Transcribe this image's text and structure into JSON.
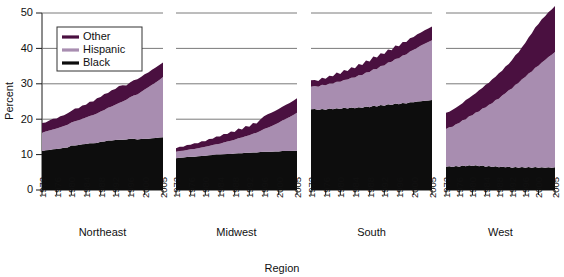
{
  "chart_data": {
    "type": "area",
    "title": "",
    "subtitle": "",
    "xlabel": "Region",
    "ylabel": "Percent",
    "ylim": [
      0,
      50
    ],
    "yticks": [
      0,
      10,
      20,
      30,
      40,
      50
    ],
    "grid": true,
    "stacked": true,
    "legend_position": "top-left",
    "legend": [
      "Other",
      "Hispanic",
      "Black"
    ],
    "series_colors": {
      "Other": "#4a1040",
      "Hispanic": "#a88db0",
      "Black": "#0d0d0d"
    },
    "panels": [
      {
        "name": "Northeast",
        "xticks": [
          "1972",
          "1976",
          "1980",
          "1984",
          "1988",
          "1992",
          "1996",
          "2000",
          "2005"
        ],
        "x": [
          1972,
          1973,
          1974,
          1975,
          1976,
          1977,
          1978,
          1979,
          1980,
          1981,
          1982,
          1983,
          1984,
          1985,
          1986,
          1987,
          1988,
          1989,
          1990,
          1991,
          1992,
          1993,
          1994,
          1995,
          1996,
          1997,
          1998,
          1999,
          2000,
          2001,
          2002,
          2003,
          2004,
          2005
        ],
        "series": [
          {
            "name": "Black",
            "values": [
              11.0,
              11.2,
              11.3,
              11.5,
              11.6,
              11.7,
              11.9,
              12.0,
              12.6,
              12.6,
              12.7,
              12.9,
              13.0,
              13.2,
              13.2,
              13.3,
              13.6,
              13.7,
              14.0,
              14.0,
              14.1,
              14.2,
              14.2,
              14.3,
              14.5,
              14.5,
              14.3,
              14.4,
              14.5,
              14.5,
              14.6,
              14.7,
              14.8,
              14.9
            ]
          },
          {
            "name": "Hispanic",
            "values": [
              5.2,
              5.3,
              5.5,
              5.6,
              5.8,
              6.0,
              6.2,
              6.4,
              6.5,
              6.8,
              7.0,
              7.2,
              7.5,
              7.7,
              8.0,
              8.3,
              8.6,
              8.9,
              9.2,
              9.6,
              10.0,
              10.4,
              10.8,
              11.2,
              11.7,
              12.2,
              12.7,
              13.3,
              13.9,
              14.5,
              15.1,
              15.7,
              16.3,
              17.0
            ]
          },
          {
            "name": "Other",
            "values": [
              2.7,
              2.6,
              2.8,
              3.0,
              2.8,
              3.1,
              3.0,
              3.3,
              3.2,
              3.6,
              3.4,
              3.8,
              3.6,
              4.0,
              3.8,
              4.3,
              4.1,
              4.5,
              4.2,
              4.6,
              4.4,
              4.8,
              4.6,
              4.0,
              4.2,
              4.3,
              4.3,
              4.2,
              4.3,
              4.2,
              4.3,
              4.2,
              4.2,
              4.1
            ]
          }
        ]
      },
      {
        "name": "Midwest",
        "xticks": [
          "1972",
          "1976",
          "1980",
          "1984",
          "1988",
          "1992",
          "1996",
          "2000",
          "2005"
        ],
        "x": [
          1972,
          1973,
          1974,
          1975,
          1976,
          1977,
          1978,
          1979,
          1980,
          1981,
          1982,
          1983,
          1984,
          1985,
          1986,
          1987,
          1988,
          1989,
          1990,
          1991,
          1992,
          1993,
          1994,
          1995,
          1996,
          1997,
          1998,
          1999,
          2000,
          2001,
          2002,
          2003,
          2004,
          2005
        ],
        "series": [
          {
            "name": "Black",
            "values": [
              9.0,
              9.1,
              9.2,
              9.3,
              9.4,
              9.4,
              9.5,
              9.6,
              9.7,
              9.8,
              9.9,
              10.0,
              10.0,
              10.1,
              10.2,
              10.2,
              10.3,
              10.4,
              10.4,
              10.5,
              10.5,
              10.6,
              10.6,
              10.7,
              10.8,
              10.8,
              10.8,
              10.9,
              10.9,
              11.0,
              11.0,
              11.0,
              11.1,
              11.1
            ]
          },
          {
            "name": "Hispanic",
            "values": [
              1.8,
              1.9,
              1.9,
              2.0,
              2.1,
              2.2,
              2.3,
              2.4,
              2.5,
              2.6,
              2.8,
              2.9,
              3.1,
              3.3,
              3.5,
              3.7,
              3.9,
              4.2,
              4.4,
              4.7,
              5.0,
              5.3,
              5.6,
              6.0,
              6.4,
              6.8,
              7.2,
              7.6,
              8.1,
              8.6,
              9.1,
              9.6,
              10.1,
              10.7
            ]
          },
          {
            "name": "Other",
            "values": [
              1.0,
              1.2,
              1.1,
              1.4,
              1.3,
              1.6,
              1.4,
              1.8,
              1.6,
              2.0,
              1.8,
              2.2,
              2.0,
              2.4,
              2.1,
              2.6,
              2.2,
              2.8,
              2.3,
              2.9,
              2.4,
              3.0,
              2.6,
              3.2,
              3.6,
              3.8,
              3.8,
              3.8,
              3.9,
              3.9,
              4.0,
              4.0,
              4.0,
              4.1
            ]
          }
        ]
      },
      {
        "name": "South",
        "xticks": [
          "1972",
          "1976",
          "1980",
          "1984",
          "1988",
          "1992",
          "1996",
          "2000",
          "2005"
        ],
        "x": [
          1972,
          1973,
          1974,
          1975,
          1976,
          1977,
          1978,
          1979,
          1980,
          1981,
          1982,
          1983,
          1984,
          1985,
          1986,
          1987,
          1988,
          1989,
          1990,
          1991,
          1992,
          1993,
          1994,
          1995,
          1996,
          1997,
          1998,
          1999,
          2000,
          2001,
          2002,
          2003,
          2004,
          2005
        ],
        "series": [
          {
            "name": "Black",
            "values": [
              22.8,
              22.9,
              22.6,
              22.9,
              22.7,
              23.0,
              22.8,
              23.1,
              22.9,
              23.2,
              23.0,
              23.3,
              23.1,
              23.4,
              23.2,
              23.6,
              23.4,
              23.8,
              23.6,
              24.0,
              23.8,
              24.2,
              24.0,
              24.4,
              24.2,
              24.6,
              24.4,
              24.8,
              24.8,
              25.0,
              25.1,
              25.2,
              25.3,
              25.4
            ]
          },
          {
            "name": "Hispanic",
            "values": [
              6.4,
              6.5,
              6.6,
              6.8,
              6.9,
              7.1,
              7.3,
              7.5,
              7.7,
              7.9,
              8.2,
              8.4,
              8.7,
              9.0,
              9.3,
              9.6,
              9.9,
              10.3,
              10.6,
              11.0,
              11.4,
              11.8,
              12.2,
              12.6,
              13.0,
              13.4,
              13.9,
              14.3,
              14.8,
              15.2,
              15.7,
              16.1,
              16.5,
              16.9
            ]
          },
          {
            "name": "Other",
            "values": [
              1.8,
              1.7,
              1.6,
              2.0,
              1.8,
              2.2,
              2.0,
              2.6,
              2.2,
              2.8,
              2.4,
              3.0,
              2.6,
              3.2,
              2.8,
              3.4,
              3.0,
              3.6,
              3.2,
              3.6,
              3.2,
              3.7,
              3.3,
              3.8,
              3.4,
              3.8,
              3.5,
              3.8,
              3.6,
              3.8,
              3.7,
              3.8,
              3.8,
              3.9
            ]
          }
        ]
      },
      {
        "name": "West",
        "xticks": [
          "1972",
          "1976",
          "1980",
          "1984",
          "1988",
          "1992",
          "1996",
          "2000",
          "2005"
        ],
        "x": [
          1972,
          1973,
          1974,
          1975,
          1976,
          1977,
          1978,
          1979,
          1980,
          1981,
          1982,
          1983,
          1984,
          1985,
          1986,
          1987,
          1988,
          1989,
          1990,
          1991,
          1992,
          1993,
          1994,
          1995,
          1996,
          1997,
          1998,
          1999,
          2000,
          2001,
          2002,
          2003,
          2004,
          2005
        ],
        "series": [
          {
            "name": "Black",
            "values": [
              6.6,
              6.7,
              6.5,
              6.8,
              6.6,
              6.9,
              6.7,
              7.0,
              6.8,
              7.0,
              6.7,
              6.9,
              6.6,
              6.8,
              6.5,
              6.7,
              6.4,
              6.6,
              6.4,
              6.6,
              6.3,
              6.5,
              6.3,
              6.5,
              6.3,
              6.5,
              6.3,
              6.5,
              6.3,
              6.4,
              6.3,
              6.4,
              6.3,
              6.4
            ]
          },
          {
            "name": "Hispanic",
            "values": [
              10.6,
              11.0,
              11.4,
              11.8,
              12.3,
              12.8,
              13.3,
              13.8,
              14.3,
              14.9,
              15.5,
              16.1,
              16.7,
              17.3,
              18.0,
              18.7,
              19.4,
              20.1,
              20.9,
              21.6,
              22.4,
              23.2,
              24.0,
              24.8,
              25.6,
              26.4,
              27.2,
              28.0,
              28.8,
              29.6,
              30.4,
              31.2,
              31.9,
              32.6
            ]
          },
          {
            "name": "Other",
            "values": [
              4.6,
              4.4,
              4.8,
              4.6,
              5.0,
              4.8,
              5.4,
              5.2,
              5.6,
              5.4,
              6.0,
              5.8,
              6.4,
              6.2,
              6.8,
              6.6,
              7.2,
              7.0,
              7.6,
              7.4,
              8.0,
              8.4,
              8.6,
              9.0,
              9.6,
              10.2,
              10.8,
              11.4,
              11.8,
              12.2,
              12.4,
              12.6,
              12.8,
              13.0
            ]
          }
        ]
      }
    ]
  }
}
